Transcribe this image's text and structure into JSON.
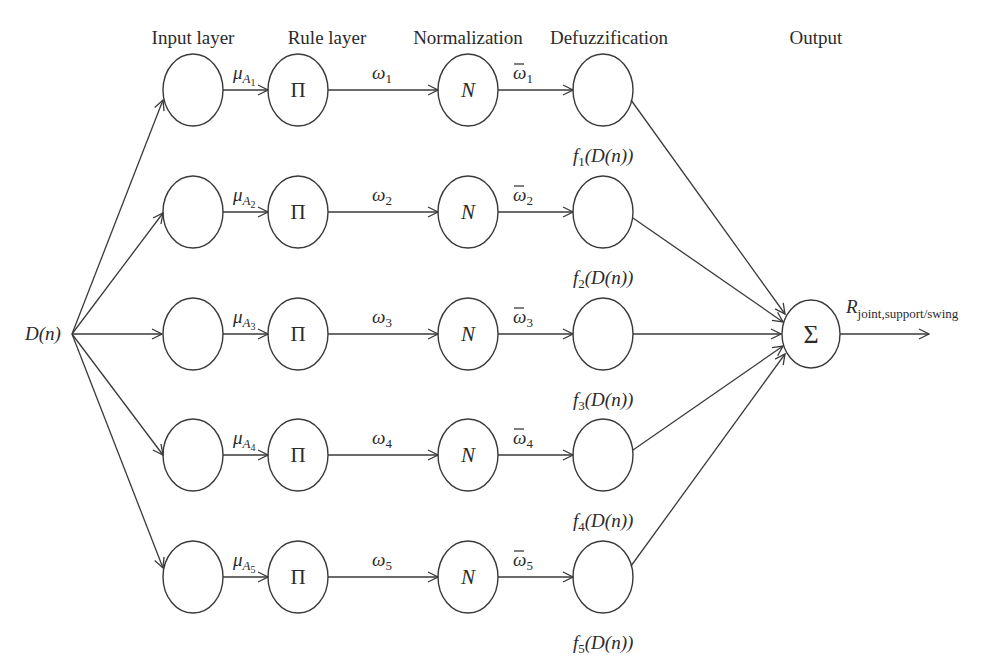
{
  "headers": {
    "input": "Input layer",
    "rule": "Rule layer",
    "norm": "Normalization",
    "defuzz": "Defuzzification",
    "output": "Output"
  },
  "input_label": "D(n)",
  "rule_symbol": "Π",
  "norm_symbol": "N",
  "sum_symbol": "Σ",
  "output_label": {
    "main": "R",
    "sub": "joint,support/swing"
  },
  "rows": [
    {
      "mu": "μ",
      "mu_sub": "A",
      "mu_subsub": "1",
      "w": "ω",
      "w_sub": "1",
      "wbar": "ω",
      "wbar_sub": "1",
      "f": "f",
      "f_sub": "1",
      "f_arg": "(D(n))"
    },
    {
      "mu": "μ",
      "mu_sub": "A",
      "mu_subsub": "2",
      "w": "ω",
      "w_sub": "2",
      "wbar": "ω",
      "wbar_sub": "2",
      "f": "f",
      "f_sub": "2",
      "f_arg": "(D(n))"
    },
    {
      "mu": "μ",
      "mu_sub": "A",
      "mu_subsub": "3",
      "w": "ω",
      "w_sub": "3",
      "wbar": "ω",
      "wbar_sub": "3",
      "f": "f",
      "f_sub": "3",
      "f_arg": "(D(n))"
    },
    {
      "mu": "μ",
      "mu_sub": "A",
      "mu_subsub": "4",
      "w": "ω",
      "w_sub": "4",
      "wbar": "ω",
      "wbar_sub": "4",
      "f": "f",
      "f_sub": "4",
      "f_arg": "(D(n))"
    },
    {
      "mu": "μ",
      "mu_sub": "A",
      "mu_subsub": "5",
      "w": "ω",
      "w_sub": "5",
      "wbar": "ω",
      "wbar_sub": "5",
      "f": "f",
      "f_sub": "5",
      "f_arg": "(D(n))"
    }
  ]
}
